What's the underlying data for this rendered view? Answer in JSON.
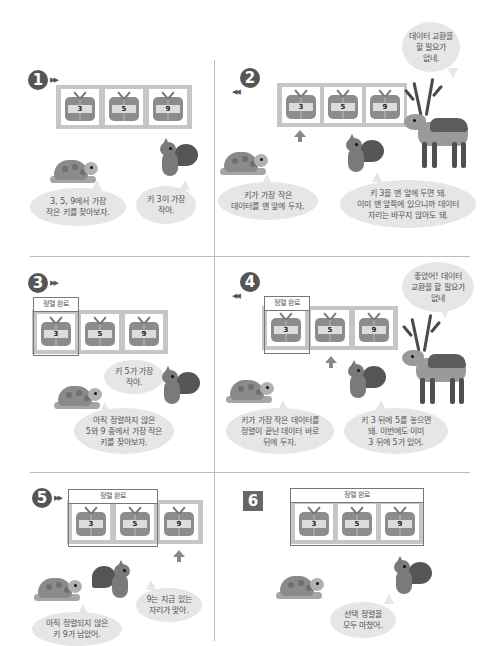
{
  "panels": [
    {
      "step": "1",
      "boxes": [
        "3",
        "5",
        "9"
      ],
      "bubbles": {
        "turtle": "3, 5, 9에서 가장\n작은 키를 찾아보자.",
        "squirrel": "키 3이 가장\n작아."
      }
    },
    {
      "step": "2",
      "boxes": [
        "3",
        "5",
        "9"
      ],
      "bubbles": {
        "turtle": "키가 가장 작은\n데이터를 맨 앞에 두자.",
        "squirrel": "키 3을 맨 앞에 두면 돼.\n이미 맨 앞쪽에 있으니까 데이터\n자리는 바꾸지 않아도 돼.",
        "deer": "데이터 교환을\n할 필요가\n없네."
      }
    },
    {
      "step": "3",
      "sorted_label": "정렬 완료",
      "boxes": [
        "3",
        "5",
        "9"
      ],
      "bubbles": {
        "squirrel": "키 5가 가장\n작아.",
        "turtle": "아직 정렬하지 않은\n5와 9 중에서 가장 작은\n키를 찾아보자."
      }
    },
    {
      "step": "4",
      "sorted_label": "정렬 완료",
      "boxes": [
        "3",
        "5",
        "9"
      ],
      "bubbles": {
        "turtle": "키가 가장 작은 데이터를\n정렬이 끝난 데이터 바로\n뒤에 두자.",
        "squirrel": "키 3 뒤에 5를 놓으면\n돼. 이번에도 이미\n3 뒤에 5가 있어.",
        "deer": "좋았어! 데이터\n교환을 할 필요가\n없네"
      }
    },
    {
      "step": "5",
      "sorted_label": "정렬 완료",
      "boxes": [
        "3",
        "5",
        "9"
      ],
      "bubbles": {
        "squirrel": "9는 지금 있는\n자리가 맞아.",
        "turtle": "아직 정렬되지 않은\n키 9가 남았어."
      }
    },
    {
      "step": "6",
      "sorted_label": "정렬 완료",
      "boxes": [
        "3",
        "5",
        "9"
      ],
      "bubbles": {
        "squirrel": "선택 정렬을\n모두 마쳤어."
      }
    }
  ],
  "colors": {
    "track": "#c6c6c6",
    "gift": "#8c8c8c",
    "bubble": "#e6e6e6",
    "badge": "#555555",
    "divider": "#bdbdbd"
  }
}
